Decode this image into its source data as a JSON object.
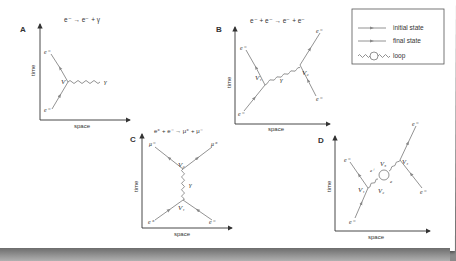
{
  "colors": {
    "line": "#666666",
    "arrow": "#8a8a8a",
    "axis": "#333333",
    "text": "#333333",
    "background": "#ffffff"
  },
  "axes": {
    "x_label": "space",
    "y_label": "time"
  },
  "legend": {
    "items": [
      {
        "label": "initial state",
        "icon": "line-with-arrow-icon"
      },
      {
        "label": "final state",
        "icon": "line-with-arrow-icon"
      },
      {
        "label": "loop",
        "icon": "wavy-loop-icon"
      }
    ]
  },
  "panels": {
    "A": {
      "label": "A",
      "reaction": "e⁻ → e⁻ + γ",
      "vertices": [
        "V"
      ],
      "particles": {
        "in": "e⁻",
        "out": "e⁻",
        "photon": "γ"
      }
    },
    "B": {
      "label": "B",
      "reaction": "e⁻ + e⁻ → e⁻ + e⁻",
      "vertices": [
        "V₁",
        "V₂"
      ],
      "particles": {
        "in1": "e⁻",
        "out1": "e⁻",
        "in2": "e⁻",
        "out2": "e⁻",
        "photon": "γ"
      }
    },
    "C": {
      "label": "C",
      "reaction": "e⁺ + e⁻ → μ⁺ + μ⁻",
      "vertices": [
        "V₁",
        "V₂"
      ],
      "particles": {
        "in1": "e⁺",
        "in2": "e⁻",
        "out1": "μ⁻",
        "out2": "μ⁺",
        "photon": "γ"
      }
    },
    "D": {
      "label": "D",
      "reaction": "",
      "vertices": [
        "V₁",
        "V₂",
        "V₃",
        "V₄"
      ],
      "particles": {
        "in1": "e⁻",
        "out1": "e⁻",
        "in2": "e⁻",
        "out2": "e⁻",
        "loop1": "e⁺",
        "loop2": "e⁻"
      }
    }
  }
}
